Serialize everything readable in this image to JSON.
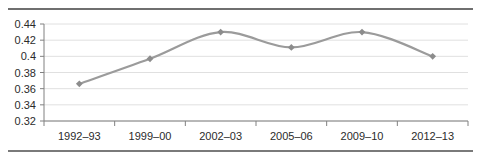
{
  "chart_data": {
    "type": "line",
    "title": "",
    "subtitle": "",
    "xlabel": "",
    "ylabel": "",
    "categories": [
      "1992–93",
      "1999–00",
      "2002–03",
      "2005–06",
      "2009–10",
      "2012–13"
    ],
    "values": [
      0.366,
      0.397,
      0.43,
      0.411,
      0.43,
      0.4
    ],
    "series": [
      {
        "name": "",
        "values": [
          0.366,
          0.397,
          0.43,
          0.411,
          0.43,
          0.4
        ]
      }
    ],
    "ylim": [
      0.32,
      0.44
    ],
    "ytick_values": [
      0.32,
      0.34,
      0.36,
      0.38,
      0.4,
      0.42,
      0.44
    ],
    "ytick_labels": [
      "0.32",
      "0.34",
      "0.36",
      "0.38",
      "0.4",
      "0.42",
      "0.44"
    ],
    "grid": true,
    "grid_axis": "y",
    "legend": false,
    "legend_position": "none",
    "smoothing": true,
    "marker": "diamond",
    "annotations": []
  },
  "style": {
    "line_color": "#9b9b9b",
    "marker_color": "#8c8c8c",
    "grid_color": "#e0e0e0",
    "axis_color": "#808080",
    "rule_color": "#6f6f6f",
    "text_color": "#2b2b2b",
    "background": "#ffffff"
  }
}
